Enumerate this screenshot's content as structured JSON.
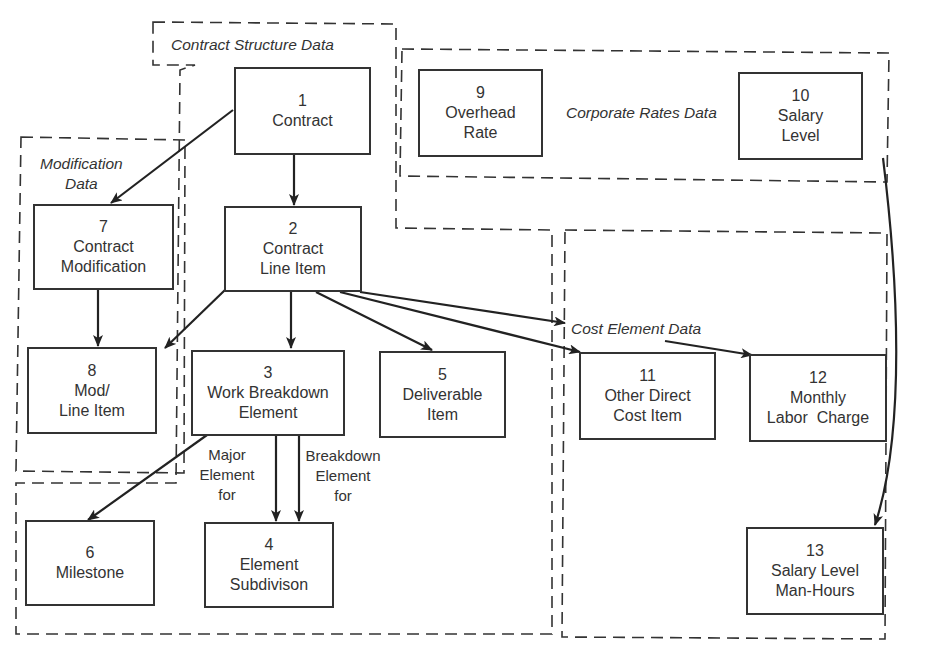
{
  "diagram": {
    "groups": [
      {
        "id": "contract-structure",
        "label": "Contract Structure Data"
      },
      {
        "id": "modification",
        "label_lines": [
          "Modification",
          "Data"
        ]
      },
      {
        "id": "corporate-rates",
        "label": "Corporate Rates Data"
      },
      {
        "id": "cost-element",
        "label": "Cost Element Data"
      }
    ],
    "entities": [
      {
        "id": 1,
        "num": "1",
        "lines": [
          "Contract"
        ]
      },
      {
        "id": 2,
        "num": "2",
        "lines": [
          "Contract",
          "Line Item"
        ]
      },
      {
        "id": 3,
        "num": "3",
        "lines": [
          "Work Breakdown",
          "Element"
        ]
      },
      {
        "id": 4,
        "num": "4",
        "lines": [
          "Element",
          "Subdivison"
        ]
      },
      {
        "id": 5,
        "num": "5",
        "lines": [
          "Deliverable",
          "Item"
        ]
      },
      {
        "id": 6,
        "num": "6",
        "lines": [
          "Milestone"
        ]
      },
      {
        "id": 7,
        "num": "7",
        "lines": [
          "Contract",
          "Modification"
        ]
      },
      {
        "id": 8,
        "num": "8",
        "lines": [
          "Mod/",
          "Line Item"
        ]
      },
      {
        "id": 9,
        "num": "9",
        "lines": [
          "Overhead",
          "Rate"
        ]
      },
      {
        "id": 10,
        "num": "10",
        "lines": [
          "Salary",
          "Level"
        ]
      },
      {
        "id": 11,
        "num": "11",
        "lines": [
          "Other Direct",
          "Cost Item"
        ]
      },
      {
        "id": 12,
        "num": "12",
        "lines": [
          "Monthly",
          "Labor  Charge"
        ]
      },
      {
        "id": 13,
        "num": "13",
        "lines": [
          "Salary Level",
          "Man-Hours"
        ]
      }
    ],
    "relationship_labels": {
      "major": [
        "Major",
        "Element",
        "for"
      ],
      "breakdown": [
        "Breakdown",
        "Element",
        "for"
      ]
    },
    "relationships": [
      {
        "from": 1,
        "to": 7
      },
      {
        "from": 1,
        "to": 2
      },
      {
        "from": 7,
        "to": 8
      },
      {
        "from": 2,
        "to": 8
      },
      {
        "from": 2,
        "to": 3
      },
      {
        "from": 2,
        "to": 5
      },
      {
        "from": 2,
        "to": 11
      },
      {
        "from": 2,
        "to": 12
      },
      {
        "from": 3,
        "to": 6
      },
      {
        "from": 3,
        "to": 4,
        "label": "Major Element for"
      },
      {
        "from": 3,
        "to": 4,
        "label": "Breakdown Element for"
      },
      {
        "from": 10,
        "to": 13
      }
    ]
  }
}
